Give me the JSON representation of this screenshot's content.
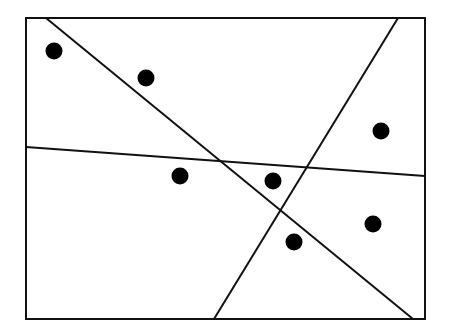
{
  "diagram": {
    "width": 452,
    "height": 334,
    "background": "#ffffff",
    "stroke_color": "#111111",
    "frame": {
      "x1": 26,
      "y1": 18,
      "x2": 425,
      "y2": 319,
      "stroke_width": 2
    },
    "lines": [
      {
        "id": "line-descending",
        "x1": 46,
        "y1": 18,
        "x2": 413,
        "y2": 319
      },
      {
        "id": "line-ascending",
        "x1": 398,
        "y1": 18,
        "x2": 214,
        "y2": 319
      },
      {
        "id": "line-horizontal",
        "x1": 26,
        "y1": 147,
        "x2": 425,
        "y2": 176
      }
    ],
    "line_width": 2,
    "points": [
      {
        "x": 54,
        "y": 51
      },
      {
        "x": 146,
        "y": 78
      },
      {
        "x": 381,
        "y": 131
      },
      {
        "x": 180,
        "y": 176
      },
      {
        "x": 273,
        "y": 181
      },
      {
        "x": 373,
        "y": 224
      },
      {
        "x": 294,
        "y": 242
      }
    ],
    "point_radius": 8.5,
    "point_color": "#000000"
  }
}
